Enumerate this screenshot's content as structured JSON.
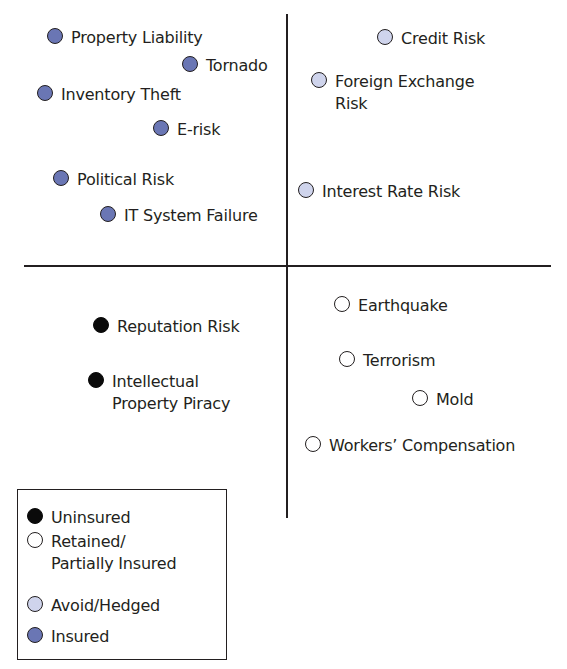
{
  "colors": {
    "uninsured": "#0a0a0a",
    "retained": "#ffffff",
    "avoid_hedged": "#cfd4ec",
    "insured": "#6a76b4",
    "stroke": "#231f20"
  },
  "items": [
    {
      "label": "Property Liability",
      "category": "insured",
      "x": 47,
      "y": 27
    },
    {
      "label": "Tornado",
      "category": "insured",
      "x": 182,
      "y": 55
    },
    {
      "label": "Inventory Theft",
      "category": "insured",
      "x": 37,
      "y": 84
    },
    {
      "label": "E-risk",
      "category": "insured",
      "x": 153,
      "y": 119
    },
    {
      "label": "Political Risk",
      "category": "insured",
      "x": 53,
      "y": 169
    },
    {
      "label": "IT System Failure",
      "category": "insured",
      "x": 100,
      "y": 205
    },
    {
      "label": "Credit Risk",
      "category": "avoid_hedged",
      "x": 377,
      "y": 28
    },
    {
      "label": "Foreign Exchange\nRisk",
      "category": "avoid_hedged",
      "x": 311,
      "y": 71
    },
    {
      "label": "Interest Rate Risk",
      "category": "avoid_hedged",
      "x": 298,
      "y": 181
    },
    {
      "label": "Reputation Risk",
      "category": "uninsured",
      "x": 93,
      "y": 316
    },
    {
      "label": "Intellectual\nProperty Piracy",
      "category": "uninsured",
      "x": 88,
      "y": 371
    },
    {
      "label": "Earthquake",
      "category": "retained",
      "x": 334,
      "y": 295
    },
    {
      "label": "Terrorism",
      "category": "retained",
      "x": 339,
      "y": 350
    },
    {
      "label": "Mold",
      "category": "retained",
      "x": 412,
      "y": 389
    },
    {
      "label": "Workers’ Compensation",
      "category": "retained",
      "x": 305,
      "y": 435
    }
  ],
  "legend": [
    {
      "label": "Uninsured",
      "category": "uninsured",
      "y": 17
    },
    {
      "label": "Retained/\nPartially Insured",
      "category": "retained",
      "y": 41
    },
    {
      "label": "Avoid/Hedged",
      "category": "avoid_hedged",
      "y": 105
    },
    {
      "label": "Insured",
      "category": "insured",
      "y": 136
    }
  ]
}
